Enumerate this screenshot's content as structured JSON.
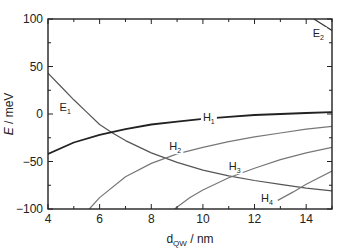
{
  "chart_data": {
    "type": "line",
    "title": "",
    "xlabel": "d_QW / nm",
    "xlabel_main": "d",
    "xlabel_sub": "QW",
    "xlabel_unit": " / nm",
    "ylabel": "E / meV",
    "ylabel_var": "E",
    "ylabel_unit": " / meV",
    "xlim": [
      4,
      15
    ],
    "ylim": [
      -100,
      100
    ],
    "xticks": [
      4,
      6,
      8,
      10,
      12,
      14
    ],
    "yticks": [
      -100,
      -50,
      0,
      50,
      100
    ],
    "ytick_labels": [
      "−100",
      "−50",
      "0",
      "50",
      "100"
    ],
    "grid": false,
    "series": [
      {
        "name": "E1",
        "label_main": "E",
        "label_sub": "1",
        "color": "#555555",
        "width": 1.2,
        "x": [
          4,
          4.5,
          5,
          5.5,
          6,
          6.5,
          7,
          8,
          9,
          10,
          11,
          12,
          13,
          14,
          15
        ],
        "y": [
          43,
          29,
          15,
          2,
          -11,
          -20,
          -28,
          -41,
          -51,
          -59,
          -65,
          -70,
          -74,
          -78,
          -81
        ],
        "label_x": 4.45,
        "label_y": 3
      },
      {
        "name": "E2",
        "label_main": "E",
        "label_sub": "2",
        "color": "#333333",
        "width": 1.2,
        "x": [
          14.3,
          15
        ],
        "y": [
          100,
          88
        ],
        "label_x": 14.25,
        "label_y": 81
      },
      {
        "name": "H1",
        "label_main": "H",
        "label_sub": "1",
        "color": "#222222",
        "width": 1.8,
        "x": [
          4,
          5,
          6,
          7,
          8,
          9,
          10,
          11,
          12,
          13,
          14,
          15
        ],
        "y": [
          -42,
          -30,
          -22,
          -16,
          -11,
          -8,
          -5,
          -3,
          -1,
          0,
          1,
          2
        ],
        "label_x": 10.0,
        "label_y": -7
      },
      {
        "name": "H2",
        "label_main": "H",
        "label_sub": "2",
        "color": "#777777",
        "width": 1.2,
        "x": [
          5.6,
          6,
          7,
          8,
          9,
          10,
          11,
          12,
          13,
          14,
          15
        ],
        "y": [
          -100,
          -88,
          -66,
          -52,
          -42,
          -35,
          -29,
          -24,
          -20,
          -16,
          -13
        ],
        "label_x": 8.7,
        "label_y": -38
      },
      {
        "name": "H3",
        "label_main": "H",
        "label_sub": "3",
        "color": "#777777",
        "width": 1.2,
        "x": [
          8.9,
          9.5,
          10,
          11,
          12,
          13,
          14,
          15
        ],
        "y": [
          -100,
          -88,
          -80,
          -67,
          -57,
          -48,
          -41,
          -35
        ],
        "label_x": 11.0,
        "label_y": -59
      },
      {
        "name": "H4",
        "label_main": "H",
        "label_sub": "4",
        "color": "#777777",
        "width": 1.2,
        "x": [
          12.9,
          13.5,
          14,
          15
        ],
        "y": [
          -91,
          -82,
          -74,
          -60
        ],
        "label_x": 12.25,
        "label_y": -93
      }
    ]
  }
}
